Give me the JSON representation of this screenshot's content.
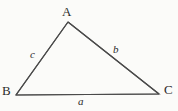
{
  "figure": {
    "kind": "geometry-diagram",
    "shape": "triangle",
    "background_color": "#fbfbf9",
    "stroke_color": "#4a4a4a",
    "text_color": "#2b2b2b",
    "stroke_width": 1.2,
    "vertices": [
      {
        "name": "A",
        "label": "A",
        "x": 68,
        "y": 22,
        "position": "apex"
      },
      {
        "name": "B",
        "label": "B",
        "x": 16,
        "y": 95,
        "position": "bottom-left"
      },
      {
        "name": "C",
        "label": "C",
        "x": 159,
        "y": 94,
        "position": "bottom-right"
      }
    ],
    "sides": [
      {
        "name": "side-a",
        "label": "a",
        "between": "B-C",
        "opposite_vertex": "A"
      },
      {
        "name": "side-b",
        "label": "b",
        "between": "A-C",
        "opposite_vertex": "B"
      },
      {
        "name": "side-c",
        "label": "c",
        "between": "A-B",
        "opposite_vertex": "C"
      }
    ]
  }
}
